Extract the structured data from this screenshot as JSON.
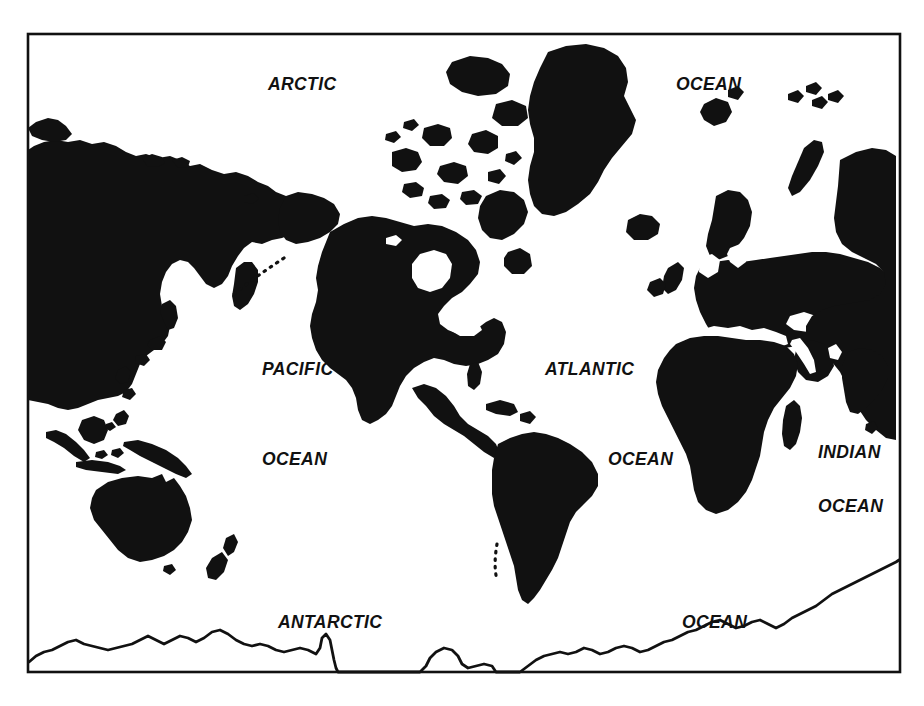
{
  "document": {
    "kind": "world-map-illustration",
    "projection": "pacific-centered rectangular",
    "style": "black silhouette landmasses on white, thin rectangular border"
  },
  "colors": {
    "land": "#111111",
    "ocean": "#ffffff",
    "border": "#111111",
    "label": "#111111",
    "page_background": "#ffffff"
  },
  "frame": {
    "x": 28,
    "y": 34,
    "width": 872,
    "height": 638,
    "stroke_width": 2.6
  },
  "labels": [
    {
      "id": "arctic",
      "text": "ARCTIC",
      "x": 268,
      "y": 90
    },
    {
      "id": "arctic-ocean",
      "text": "OCEAN",
      "x": 676,
      "y": 90
    },
    {
      "id": "pacific",
      "text": "PACIFIC",
      "x": 262,
      "y": 375
    },
    {
      "id": "pacific-ocean",
      "text": "OCEAN",
      "x": 262,
      "y": 465
    },
    {
      "id": "atlantic",
      "text": "ATLANTIC",
      "x": 545,
      "y": 375
    },
    {
      "id": "atlantic-ocean",
      "text": "OCEAN",
      "x": 608,
      "y": 465
    },
    {
      "id": "indian",
      "text": "INDIAN",
      "x": 818,
      "y": 458
    },
    {
      "id": "indian-ocean",
      "text": "OCEAN",
      "x": 818,
      "y": 512
    },
    {
      "id": "antarctic",
      "text": "ANTARCTIC",
      "x": 278,
      "y": 628
    },
    {
      "id": "southern-ocean",
      "text": "OCEAN",
      "x": 682,
      "y": 628
    }
  ],
  "landmasses": [
    "siberia-asia",
    "kamchatka",
    "japan",
    "philippines",
    "indonesia",
    "new-guinea",
    "australia",
    "new-zealand",
    "alaska",
    "aleutian-islands",
    "canada",
    "arctic-archipelago",
    "greenland",
    "iceland",
    "united-states",
    "mexico-central-america",
    "caribbean",
    "south-america",
    "europe",
    "british-isles",
    "scandinavia",
    "svalbard",
    "africa",
    "madagascar",
    "arabia",
    "india",
    "sri-lanka",
    "antarctic-coastline"
  ]
}
